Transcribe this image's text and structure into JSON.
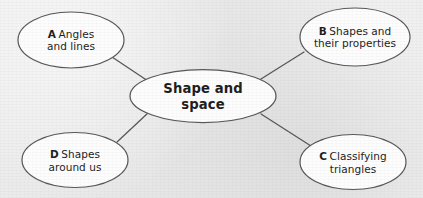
{
  "diagram": {
    "type": "mind-map",
    "title": "Shape and space",
    "background_color": "#e9e9e9",
    "node_fill_color": "#fdfdfd",
    "node_stroke_color": "#555555",
    "connector_color": "#555555",
    "text_color": "#1b1b1b",
    "central_node": {
      "id": "center",
      "lines": [
        "Shape and",
        "space"
      ],
      "full_text": "Shape and space"
    },
    "satellite_nodes": [
      {
        "id": "a",
        "key": "A",
        "lines": [
          "Angles",
          "and lines"
        ],
        "full_text": "A Angles and lines",
        "position": "top-left"
      },
      {
        "id": "b",
        "key": "B",
        "lines": [
          "Shapes and",
          "their properties"
        ],
        "full_text": "B Shapes and their properties",
        "position": "top-right"
      },
      {
        "id": "c",
        "key": "C",
        "lines": [
          "Classifying",
          "triangles"
        ],
        "full_text": "C Classifying triangles",
        "position": "bottom-right"
      },
      {
        "id": "d",
        "key": "D",
        "lines": [
          "Shapes",
          "around us"
        ],
        "full_text": "D Shapes around us",
        "position": "bottom-left"
      }
    ],
    "connectors": [
      {
        "id": "center-a",
        "from": "center",
        "to": "a"
      },
      {
        "id": "center-b",
        "from": "center",
        "to": "b"
      },
      {
        "id": "center-c",
        "from": "center",
        "to": "c"
      },
      {
        "id": "center-d",
        "from": "center",
        "to": "d"
      }
    ]
  }
}
